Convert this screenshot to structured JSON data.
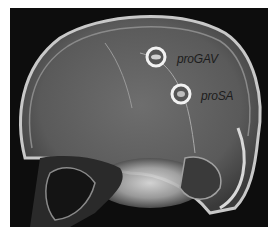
{
  "image": {
    "description": "Lateral skull X-ray showing two implanted shunt valves",
    "background_color": "#0d0d0d",
    "frame_color": "#ffffff"
  },
  "labels": {
    "valve_upper": "proGAV",
    "valve_lower": "proSA"
  }
}
